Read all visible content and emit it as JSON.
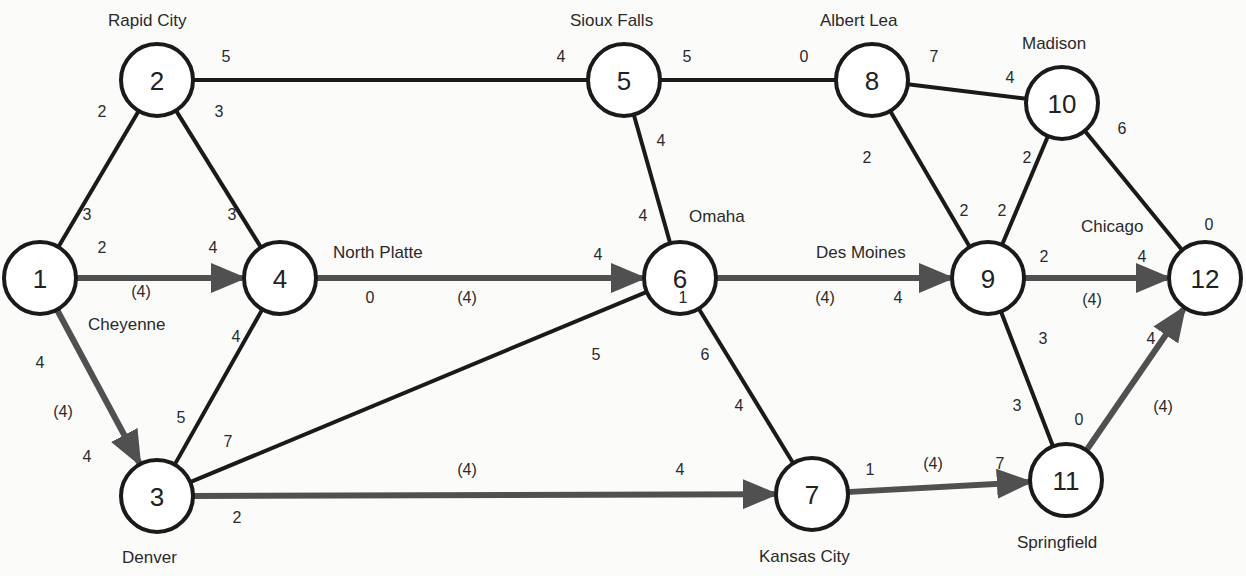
{
  "diagram": {
    "type": "network-flow",
    "colors": {
      "edge": "#1a1a1a",
      "flow_path": "#505050",
      "node_fill": "#ffffff",
      "background": "#fbfbfa"
    },
    "nodes": [
      {
        "id": "1",
        "x": 40,
        "y": 278,
        "city": "Cheyenne",
        "city_x": 88,
        "city_y": 330
      },
      {
        "id": "2",
        "x": 157,
        "y": 80,
        "city": "Rapid City",
        "city_x": 108,
        "city_y": 26
      },
      {
        "id": "3",
        "x": 157,
        "y": 496,
        "city": "Denver",
        "city_x": 122,
        "city_y": 563
      },
      {
        "id": "4",
        "x": 280,
        "y": 278,
        "city": "North Platte",
        "city_x": 333,
        "city_y": 258
      },
      {
        "id": "5",
        "x": 624,
        "y": 80,
        "city": "Sioux Falls",
        "city_x": 570,
        "city_y": 26
      },
      {
        "id": "6",
        "x": 680,
        "y": 278,
        "city": "Omaha",
        "city_x": 689,
        "city_y": 222
      },
      {
        "id": "7",
        "x": 812,
        "y": 494,
        "city": "Kansas City",
        "city_x": 759,
        "city_y": 562
      },
      {
        "id": "8",
        "x": 872,
        "y": 80,
        "city": "Albert Lea",
        "city_x": 820,
        "city_y": 26
      },
      {
        "id": "9",
        "x": 988,
        "y": 278,
        "city": "Des Moines",
        "city_x": 816,
        "city_y": 258
      },
      {
        "id": "10",
        "x": 1062,
        "y": 103,
        "city": "Madison",
        "city_x": 1022,
        "city_y": 49
      },
      {
        "id": "11",
        "x": 1066,
        "y": 480,
        "city": "Springfield",
        "city_x": 1017,
        "city_y": 548
      },
      {
        "id": "12",
        "x": 1205,
        "y": 278,
        "city": "Chicago",
        "city_x": 1081,
        "city_y": 232
      }
    ],
    "edges": [
      {
        "from": "1",
        "to": "2",
        "flow": false,
        "cap_from": "3",
        "cap_to": "2",
        "flow_value": ""
      },
      {
        "from": "1",
        "to": "4",
        "flow": true,
        "cap_from": "2",
        "cap_to": "4",
        "flow_value": "(4)"
      },
      {
        "from": "1",
        "to": "3",
        "flow": true,
        "cap_from": "4",
        "cap_to": "4",
        "flow_value": "(4)"
      },
      {
        "from": "2",
        "to": "4",
        "flow": false,
        "cap_from": "3",
        "cap_to": "3",
        "flow_value": ""
      },
      {
        "from": "2",
        "to": "5",
        "flow": false,
        "cap_from": "5",
        "cap_to": "4",
        "flow_value": ""
      },
      {
        "from": "3",
        "to": "4",
        "flow": false,
        "cap_from": "5",
        "cap_to": "4",
        "flow_value": ""
      },
      {
        "from": "3",
        "to": "6",
        "flow": false,
        "cap_from": "7",
        "cap_to": "5",
        "flow_value": ""
      },
      {
        "from": "3",
        "to": "7",
        "flow": true,
        "cap_from": "2",
        "cap_to": "4",
        "flow_value": "(4)"
      },
      {
        "from": "4",
        "to": "6",
        "flow": true,
        "cap_from": "0",
        "cap_to": "4",
        "flow_value": "(4)"
      },
      {
        "from": "5",
        "to": "6",
        "flow": false,
        "cap_from": "4",
        "cap_to": "4",
        "flow_value": ""
      },
      {
        "from": "5",
        "to": "8",
        "flow": false,
        "cap_from": "5",
        "cap_to": "0",
        "flow_value": ""
      },
      {
        "from": "6",
        "to": "9",
        "flow": true,
        "cap_from": "1",
        "cap_to": "4",
        "flow_value": "(4)"
      },
      {
        "from": "6",
        "to": "7",
        "flow": false,
        "cap_from": "6",
        "cap_to": "4",
        "flow_value": ""
      },
      {
        "from": "7",
        "to": "11",
        "flow": true,
        "cap_from": "1",
        "cap_to": "7",
        "flow_value": "(4)"
      },
      {
        "from": "8",
        "to": "10",
        "flow": false,
        "cap_from": "7",
        "cap_to": "4",
        "flow_value": ""
      },
      {
        "from": "8",
        "to": "9",
        "flow": false,
        "cap_from": "2",
        "cap_to": "2",
        "flow_value": ""
      },
      {
        "from": "9",
        "to": "10",
        "flow": false,
        "cap_from": "2",
        "cap_to": "2",
        "flow_value": ""
      },
      {
        "from": "9",
        "to": "12",
        "flow": true,
        "cap_from": "2",
        "cap_to": "4",
        "flow_value": "(4)"
      },
      {
        "from": "9",
        "to": "11",
        "flow": false,
        "cap_from": "3",
        "cap_to": "3",
        "flow_value": ""
      },
      {
        "from": "10",
        "to": "12",
        "flow": false,
        "cap_from": "6",
        "cap_to": "0",
        "flow_value": ""
      },
      {
        "from": "11",
        "to": "12",
        "flow": true,
        "cap_from": "0",
        "cap_to": "4",
        "flow_value": "(4)"
      }
    ],
    "labels": [
      {
        "text": "2",
        "x": 102,
        "y": 111
      },
      {
        "text": "5",
        "x": 226,
        "y": 56
      },
      {
        "text": "3",
        "x": 219,
        "y": 111
      },
      {
        "text": "3",
        "x": 87,
        "y": 214
      },
      {
        "text": "3",
        "x": 232,
        "y": 214
      },
      {
        "text": "2",
        "x": 102,
        "y": 247
      },
      {
        "text": "4",
        "x": 213,
        "y": 247
      },
      {
        "text": "(4)",
        "x": 141,
        "y": 291
      },
      {
        "text": "4",
        "x": 40,
        "y": 362
      },
      {
        "text": "(4)",
        "x": 63,
        "y": 411
      },
      {
        "text": "4",
        "x": 87,
        "y": 456
      },
      {
        "text": "4",
        "x": 236,
        "y": 336
      },
      {
        "text": "5",
        "x": 181,
        "y": 417
      },
      {
        "text": "7",
        "x": 228,
        "y": 441
      },
      {
        "text": "2",
        "x": 237,
        "y": 517
      },
      {
        "text": "0",
        "x": 370,
        "y": 297
      },
      {
        "text": "(4)",
        "x": 467,
        "y": 297
      },
      {
        "text": "4",
        "x": 598,
        "y": 254
      },
      {
        "text": "4",
        "x": 561,
        "y": 56
      },
      {
        "text": "5",
        "x": 687,
        "y": 56
      },
      {
        "text": "4",
        "x": 661,
        "y": 140
      },
      {
        "text": "4",
        "x": 643,
        "y": 215
      },
      {
        "text": "5",
        "x": 596,
        "y": 354
      },
      {
        "text": "1",
        "x": 683,
        "y": 297
      },
      {
        "text": "6",
        "x": 705,
        "y": 354
      },
      {
        "text": "4",
        "x": 739,
        "y": 405
      },
      {
        "text": "(4)",
        "x": 825,
        "y": 297
      },
      {
        "text": "4",
        "x": 898,
        "y": 297
      },
      {
        "text": "(4)",
        "x": 467,
        "y": 469
      },
      {
        "text": "4",
        "x": 680,
        "y": 469
      },
      {
        "text": "1",
        "x": 870,
        "y": 469
      },
      {
        "text": "(4)",
        "x": 933,
        "y": 463
      },
      {
        "text": "7",
        "x": 1000,
        "y": 463
      },
      {
        "text": "0",
        "x": 804,
        "y": 56
      },
      {
        "text": "7",
        "x": 934,
        "y": 56
      },
      {
        "text": "4",
        "x": 1010,
        "y": 77
      },
      {
        "text": "2",
        "x": 867,
        "y": 157
      },
      {
        "text": "2",
        "x": 964,
        "y": 210
      },
      {
        "text": "2",
        "x": 1002,
        "y": 210
      },
      {
        "text": "2",
        "x": 1027,
        "y": 157
      },
      {
        "text": "6",
        "x": 1122,
        "y": 128
      },
      {
        "text": "0",
        "x": 1209,
        "y": 224
      },
      {
        "text": "2",
        "x": 1044,
        "y": 256
      },
      {
        "text": "4",
        "x": 1142,
        "y": 256
      },
      {
        "text": "(4)",
        "x": 1092,
        "y": 299
      },
      {
        "text": "3",
        "x": 1043,
        "y": 338
      },
      {
        "text": "3",
        "x": 1017,
        "y": 405
      },
      {
        "text": "0",
        "x": 1079,
        "y": 419
      },
      {
        "text": "4",
        "x": 1151,
        "y": 338
      },
      {
        "text": "(4)",
        "x": 1163,
        "y": 406
      }
    ]
  }
}
